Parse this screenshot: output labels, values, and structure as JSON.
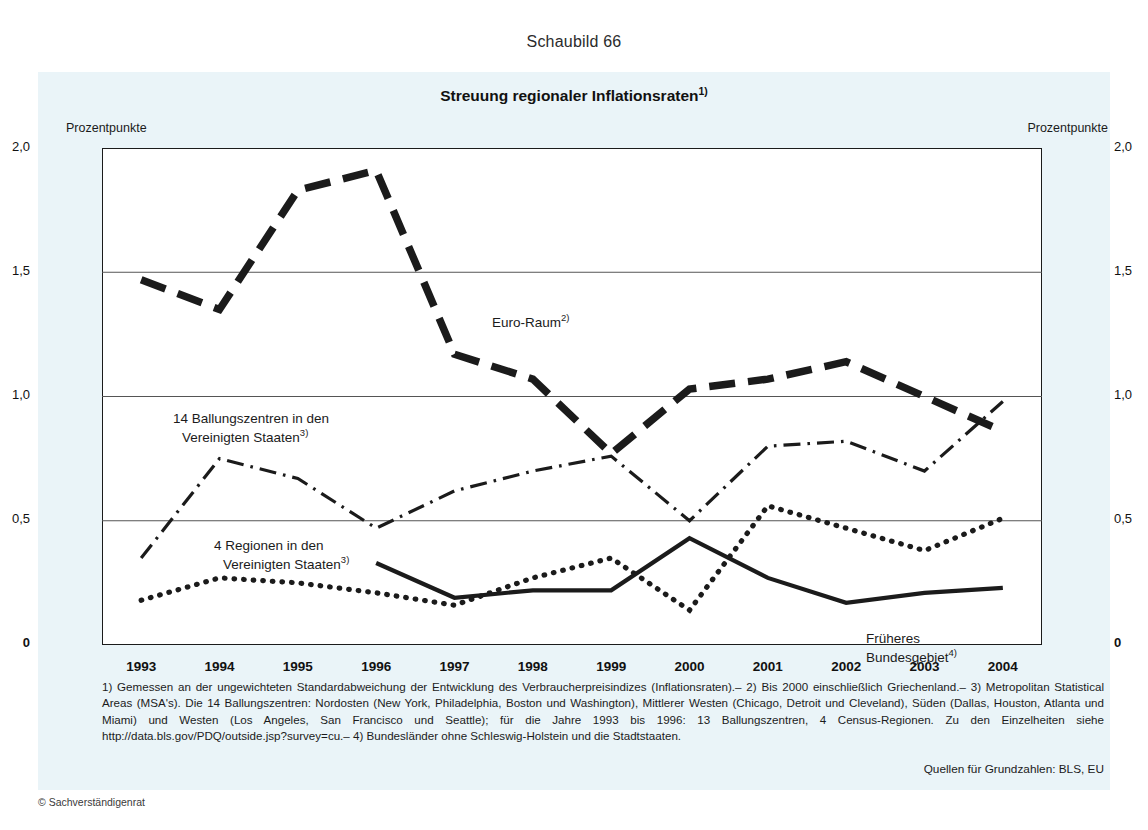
{
  "figure_number": "Schaubild 66",
  "title": {
    "text": "Streuung regionaler Inflationsraten",
    "footnote_marker": "1)"
  },
  "axis": {
    "unit_left": "Prozentpunkte",
    "unit_right": "Prozentpunkte",
    "y_ticks": [
      "2,0",
      "1,5",
      "1,0",
      "0,5",
      "0"
    ],
    "y_ticks_right": [
      "2,0",
      "1,5",
      "1,0",
      "0,5",
      "0"
    ],
    "x_ticks": [
      "1993",
      "1994",
      "1995",
      "1996",
      "1997",
      "1998",
      "1999",
      "2000",
      "2001",
      "2002",
      "2003",
      "2004"
    ]
  },
  "annotations": {
    "euro_raum": {
      "text": "Euro-Raum",
      "sup": "2)"
    },
    "ballungszentren": {
      "line1": "14 Ballungszentren in den",
      "line2": "Vereinigten Staaten",
      "sup": "3)"
    },
    "regionen": {
      "line1": "4 Regionen in den",
      "line2": "Vereinigten Staaten",
      "sup": "3)"
    },
    "bundesgebiet": {
      "line1": "Früheres",
      "line2": "Bundesgebiet",
      "sup": "4)"
    }
  },
  "footnotes": "1) Gemessen an der ungewichteten Standardabweichung der Entwicklung des Verbraucherpreisindizes (Inflationsraten).– 2) Bis 2000 einschließlich Griechenland.– 3) Metropolitan Statistical Areas (MSA's). Die 14 Ballungszentren: Nordosten (New York, Philadelphia, Boston und Washington), Mittlerer Westen (Chicago, Detroit und Cleveland), Süden (Dallas, Houston, Atlanta und Miami) und Westen (Los Angeles, San Francisco und Seattle); für die Jahre 1993 bis 1996: 13 Ballungszentren, 4 Census-Regionen. Zu den Einzelheiten siehe http://data.bls.gov/PDQ/outside.jsp?survey=cu.– 4) Bundesländer ohne Schleswig-Holstein und die Stadtstaaten.",
  "source_line": "Quellen für Grundzahlen: BLS, EU",
  "copyright": "© Sachverständigenrat",
  "colors": {
    "panel_background": "#eaf4f8",
    "plot_background": "#ffffff",
    "ink": "#1b1b1b",
    "gridline": "#555555"
  },
  "chart_data": {
    "type": "line",
    "title": "Streuung regionaler Inflationsraten",
    "xlabel": "",
    "ylabel": "Prozentpunkte",
    "ylim": [
      0,
      2.0
    ],
    "ygrid": [
      0.5,
      1.0,
      1.5
    ],
    "grid": true,
    "legend": "in-plot annotations",
    "x": [
      1993,
      1994,
      1995,
      1996,
      1997,
      1998,
      1999,
      2000,
      2001,
      2002,
      2003,
      2004
    ],
    "series": [
      {
        "name": "Euro-Raum",
        "style": "thick-dashed",
        "x": [
          1993,
          1994,
          1995,
          1996,
          1997,
          1998,
          1999,
          2000,
          2001,
          2002,
          2003,
          2004
        ],
        "values": [
          1.47,
          1.35,
          1.83,
          1.91,
          1.17,
          1.07,
          0.77,
          1.03,
          1.07,
          1.14,
          1.0,
          0.86
        ]
      },
      {
        "name": "14 Ballungszentren in den Vereinigten Staaten",
        "style": "dash-dot",
        "x": [
          1993,
          1994,
          1995,
          1996,
          1997,
          1998,
          1999,
          2000,
          2001,
          2002,
          2003,
          2004
        ],
        "values": [
          0.35,
          0.75,
          0.67,
          0.47,
          0.62,
          0.7,
          0.76,
          0.5,
          0.8,
          0.82,
          0.7,
          0.98
        ]
      },
      {
        "name": "4 Regionen in den Vereinigten Staaten",
        "style": "dotted",
        "x": [
          1993,
          1994,
          1995,
          1996,
          1997,
          1998,
          1999,
          2000,
          2001,
          2002,
          2003,
          2004
        ],
        "values": [
          0.18,
          0.27,
          0.25,
          0.21,
          0.16,
          0.27,
          0.35,
          0.14,
          0.56,
          0.47,
          0.38,
          0.51
        ]
      },
      {
        "name": "Früheres Bundesgebiet",
        "style": "solid",
        "x": [
          1996,
          1997,
          1998,
          1999,
          2000,
          2001,
          2002,
          2003,
          2004
        ],
        "values": [
          0.33,
          0.19,
          0.22,
          0.22,
          0.43,
          0.27,
          0.17,
          0.21,
          0.23
        ]
      }
    ]
  }
}
